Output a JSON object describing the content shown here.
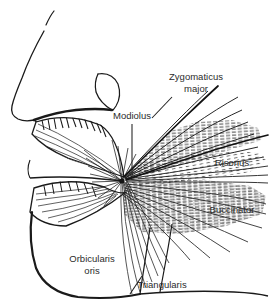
{
  "figure": {
    "background_color": "#ffffff",
    "ink_color": "#1a1a1a",
    "label_color": "#2b2b2b",
    "width": 270,
    "height": 306
  },
  "labels": [
    {
      "id": "zygomaticus-major",
      "line1": "Zygomaticus",
      "line2": "major",
      "x": 196,
      "y": 80,
      "x2": 196,
      "y2": 92,
      "leader": {
        "x1": 172,
        "y1": 97,
        "x2": 152,
        "y2": 118
      }
    },
    {
      "id": "modiolus",
      "line1": "Modiolus",
      "line2": "",
      "x": 132,
      "y": 119,
      "x2": 0,
      "y2": 0,
      "leader": {
        "x1": 132,
        "y1": 124,
        "x2": 132,
        "y2": 178
      }
    },
    {
      "id": "risorius",
      "line1": "Risorius",
      "line2": "",
      "x": 232,
      "y": 166,
      "x2": 0,
      "y2": 0,
      "leader": null
    },
    {
      "id": "buccinator",
      "line1": "Buccinator",
      "line2": "",
      "x": 232,
      "y": 213,
      "x2": 0,
      "y2": 0,
      "leader": null
    },
    {
      "id": "orbicularis-oris",
      "line1": "Orbicularis",
      "line2": "oris",
      "x": 92,
      "y": 262,
      "x2": 92,
      "y2": 274,
      "leader": null
    },
    {
      "id": "triangularis",
      "line1": "Triangularis",
      "line2": "",
      "x": 162,
      "y": 288,
      "x2": 0,
      "y2": 0,
      "leader": {
        "x1": 130,
        "y1": 294,
        "x2": 142,
        "y2": 276
      }
    }
  ],
  "anatomy": {
    "modiolus_point": {
      "x": 122,
      "y": 181
    },
    "structures": [
      "nose-profile",
      "nostril",
      "upper-lip",
      "lower-lip",
      "chin",
      "jawline",
      "cheek-muscle-mass",
      "zygomaticus-major-fibers",
      "risorius-fibers",
      "buccinator-fibers",
      "triangularis-fibers",
      "orbicularis-oris-fibers"
    ]
  }
}
